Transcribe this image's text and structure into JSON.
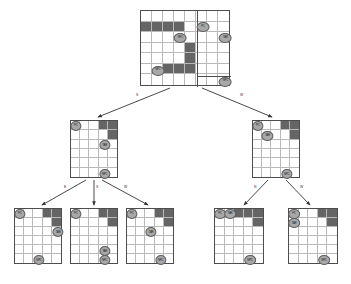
{
  "diagram": {
    "type": "search-tree",
    "colors": {
      "background": "#ffffff",
      "grid_line": "#b9b9b9",
      "grid_border": "#4d4d4d",
      "obstacle": "#656565",
      "token_fill": "#a8a8a8",
      "token_stroke": "#5d5d5d",
      "arrow": "#333333",
      "label_text": "#2b2b2b"
    },
    "token_labels": {
      "pc": "PC",
      "target": "TAR",
      "npc": "NPC"
    },
    "action_labels": {
      "east": "E",
      "south": "S",
      "west": "W",
      "north": "N"
    }
  },
  "nodes": [
    {
      "id": "root",
      "level": 0,
      "x": 140,
      "y": 10,
      "width": 90,
      "height": 76,
      "cols": 8,
      "rows": 7,
      "blocked": [
        [
          0,
          1
        ],
        [
          1,
          1
        ],
        [
          2,
          1
        ],
        [
          3,
          1
        ],
        [
          4,
          3
        ],
        [
          4,
          4
        ],
        [
          2,
          5
        ],
        [
          3,
          5
        ],
        [
          4,
          5
        ]
      ],
      "tokens": [
        {
          "label": "PC",
          "col": 5,
          "row": 1
        },
        {
          "label": "TAR",
          "col": 7,
          "row": 2
        },
        {
          "label": "NPC",
          "col": 3,
          "row": 2
        },
        {
          "label": "NPC",
          "col": 1,
          "row": 5
        },
        {
          "label": "NPC",
          "col": 7,
          "row": 6
        }
      ],
      "partition": {
        "col": 5,
        "row": 6
      }
    },
    {
      "id": "mid-left",
      "level": 1,
      "x": 70,
      "y": 120,
      "width": 48,
      "height": 58,
      "cols": 5,
      "rows": 6,
      "blocked": [
        [
          3,
          0
        ],
        [
          4,
          0
        ],
        [
          4,
          1
        ]
      ],
      "tokens": [
        {
          "label": "PC",
          "col": 0,
          "row": 0
        },
        {
          "label": "TAR",
          "col": 3,
          "row": 2
        },
        {
          "label": "NPC",
          "col": 3,
          "row": 5
        }
      ]
    },
    {
      "id": "mid-right",
      "level": 1,
      "x": 252,
      "y": 120,
      "width": 48,
      "height": 58,
      "cols": 5,
      "rows": 6,
      "blocked": [
        [
          3,
          0
        ],
        [
          4,
          0
        ],
        [
          4,
          1
        ]
      ],
      "tokens": [
        {
          "label": "PC",
          "col": 0,
          "row": 0
        },
        {
          "label": "TAR",
          "col": 1,
          "row": 1
        },
        {
          "label": "NPC",
          "col": 3,
          "row": 5
        }
      ]
    },
    {
      "id": "leaf-1",
      "level": 2,
      "x": 14,
      "y": 208,
      "width": 48,
      "height": 56,
      "cols": 5,
      "rows": 6,
      "blocked": [
        [
          3,
          0
        ],
        [
          4,
          0
        ],
        [
          4,
          1
        ]
      ],
      "tokens": [
        {
          "label": "PC",
          "col": 0,
          "row": 0
        },
        {
          "label": "TAR",
          "col": 4,
          "row": 2
        },
        {
          "label": "NPC",
          "col": 2,
          "row": 5
        }
      ]
    },
    {
      "id": "leaf-2",
      "level": 2,
      "x": 70,
      "y": 208,
      "width": 48,
      "height": 56,
      "cols": 5,
      "rows": 6,
      "blocked": [
        [
          3,
          0
        ],
        [
          4,
          0
        ],
        [
          4,
          1
        ]
      ],
      "tokens": [
        {
          "label": "PC",
          "col": 0,
          "row": 0
        },
        {
          "label": "TAR",
          "col": 3,
          "row": 4
        },
        {
          "label": "NPC",
          "col": 3,
          "row": 5
        }
      ]
    },
    {
      "id": "leaf-3",
      "level": 2,
      "x": 126,
      "y": 208,
      "width": 48,
      "height": 56,
      "cols": 5,
      "rows": 6,
      "blocked": [
        [
          3,
          0
        ],
        [
          4,
          0
        ],
        [
          4,
          1
        ]
      ],
      "tokens": [
        {
          "label": "PC",
          "col": 0,
          "row": 0
        },
        {
          "label": "TAR",
          "col": 2,
          "row": 2
        },
        {
          "label": "NPC",
          "col": 3,
          "row": 5
        }
      ]
    },
    {
      "id": "leaf-4",
      "level": 2,
      "x": 214,
      "y": 208,
      "width": 50,
      "height": 56,
      "cols": 5,
      "rows": 6,
      "blocked": [
        [
          2,
          0
        ],
        [
          3,
          0
        ],
        [
          4,
          0
        ],
        [
          4,
          1
        ]
      ],
      "tokens": [
        {
          "label": "PC",
          "col": 0,
          "row": 0
        },
        {
          "label": "TAR",
          "col": 1,
          "row": 0
        },
        {
          "label": "NPC",
          "col": 3,
          "row": 5
        }
      ]
    },
    {
      "id": "leaf-5",
      "level": 2,
      "x": 288,
      "y": 208,
      "width": 50,
      "height": 56,
      "cols": 5,
      "rows": 6,
      "blocked": [
        [
          3,
          0
        ],
        [
          4,
          0
        ],
        [
          4,
          1
        ]
      ],
      "tokens": [
        {
          "label": "PC",
          "col": 0,
          "row": 0
        },
        {
          "label": "TAR",
          "col": 0,
          "row": 1
        },
        {
          "label": "NPC",
          "col": 3,
          "row": 5
        }
      ]
    }
  ],
  "edges": [
    {
      "id": "edge-root-left",
      "from": "root",
      "to": "mid-left",
      "label": "S",
      "x1": 170,
      "y1": 88,
      "x2": 98,
      "y2": 117,
      "lx": 136,
      "ly": 94
    },
    {
      "id": "edge-root-right",
      "from": "root",
      "to": "mid-right",
      "label": "W",
      "x1": 202,
      "y1": 88,
      "x2": 272,
      "y2": 117,
      "lx": 240,
      "ly": 94
    },
    {
      "id": "edge-left-leaf1",
      "from": "mid-left",
      "to": "leaf-1",
      "label": "E",
      "x1": 86,
      "y1": 180,
      "x2": 42,
      "y2": 205,
      "lx": 64,
      "ly": 186
    },
    {
      "id": "edge-left-leaf2",
      "from": "mid-left",
      "to": "leaf-2",
      "label": "S",
      "x1": 94,
      "y1": 180,
      "x2": 94,
      "y2": 205,
      "lx": 96,
      "ly": 186
    },
    {
      "id": "edge-left-leaf3",
      "from": "mid-left",
      "to": "leaf-3",
      "label": "W",
      "x1": 102,
      "y1": 180,
      "x2": 148,
      "y2": 205,
      "lx": 124,
      "ly": 186
    },
    {
      "id": "edge-right-leaf4",
      "from": "mid-right",
      "to": "leaf-4",
      "label": "N",
      "x1": 268,
      "y1": 180,
      "x2": 244,
      "y2": 205,
      "lx": 254,
      "ly": 186
    },
    {
      "id": "edge-right-leaf5",
      "from": "mid-right",
      "to": "leaf-5",
      "label": "W",
      "x1": 286,
      "y1": 180,
      "x2": 310,
      "y2": 205,
      "lx": 300,
      "ly": 186
    }
  ]
}
